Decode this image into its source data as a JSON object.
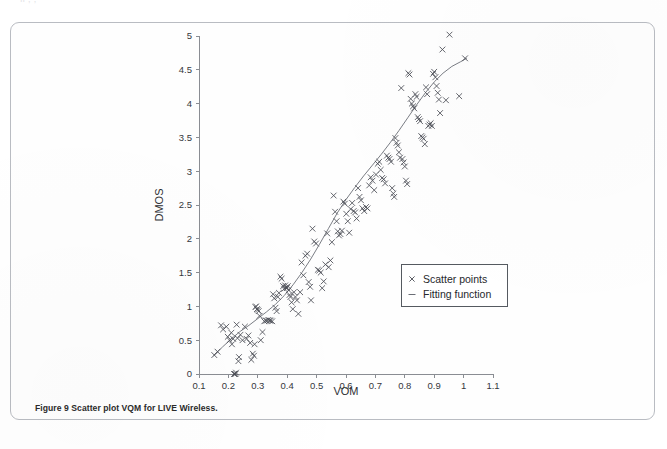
{
  "page": {
    "background_color": "#ffffff",
    "clipped_top_text": "       ll                                                          ,                   ,"
  },
  "figure": {
    "frame_color": "#b9bcc2",
    "caption_label": "Figure 9",
    "caption_text": "Scatter plot VQM for LIVE Wireless.",
    "caption_full": "Figure 9 Scatter plot VQM for LIVE Wireless."
  },
  "legend": {
    "position": "inside-right-lower",
    "border_color": "#555a60",
    "items": [
      {
        "marker": "x",
        "label": "Scatter points"
      },
      {
        "marker": "-",
        "label": "Fitting function"
      }
    ]
  },
  "chart_data": {
    "type": "scatter",
    "title": "",
    "xlabel": "VQM",
    "ylabel": "DMOS",
    "xlim": [
      0.1,
      1.1
    ],
    "ylim": [
      0,
      5
    ],
    "xticks": [
      "0.1",
      "0.2",
      "0.3",
      "0.4",
      "0.5",
      "0.6",
      "0.7",
      "0.8",
      "0.9",
      "1",
      "1.1"
    ],
    "xtick_values": [
      0.1,
      0.2,
      0.3,
      0.4,
      0.5,
      0.6,
      0.7,
      0.8,
      0.9,
      1.0,
      1.1
    ],
    "yticks": [
      "0",
      "0.5",
      "1",
      "1.5",
      "2",
      "2.5",
      "3",
      "3.5",
      "4",
      "4.5",
      "5"
    ],
    "ytick_values": [
      0,
      0.5,
      1,
      1.5,
      2,
      2.5,
      3,
      3.5,
      4,
      4.5,
      5
    ],
    "grid": false,
    "axis_color": "#8a8d93",
    "marker_color": "#4a4d55",
    "line_color": "#6b6e76",
    "marker_symbol": "x",
    "series": [
      {
        "name": "Scatter points",
        "type": "scatter",
        "points": [
          [
            0.152,
            0.28
          ],
          [
            0.163,
            0.33
          ],
          [
            0.175,
            0.72
          ],
          [
            0.182,
            0.66
          ],
          [
            0.193,
            0.7
          ],
          [
            0.198,
            0.55
          ],
          [
            0.204,
            0.5
          ],
          [
            0.21,
            0.61
          ],
          [
            0.212,
            0.44
          ],
          [
            0.216,
            0.52
          ],
          [
            0.219,
            0.0
          ],
          [
            0.222,
            0.0
          ],
          [
            0.224,
            0.0
          ],
          [
            0.226,
            0.02
          ],
          [
            0.228,
            0.73
          ],
          [
            0.231,
            0.53
          ],
          [
            0.234,
            0.19
          ],
          [
            0.236,
            0.25
          ],
          [
            0.241,
            0.58
          ],
          [
            0.248,
            0.5
          ],
          [
            0.256,
            0.7
          ],
          [
            0.262,
            0.52
          ],
          [
            0.268,
            0.57
          ],
          [
            0.274,
            0.46
          ],
          [
            0.278,
            0.21
          ],
          [
            0.283,
            0.3
          ],
          [
            0.287,
            0.27
          ],
          [
            0.289,
            0.44
          ],
          [
            0.292,
            0.99
          ],
          [
            0.294,
            1.0
          ],
          [
            0.297,
            0.96
          ],
          [
            0.3,
            0.95
          ],
          [
            0.303,
            0.93
          ],
          [
            0.306,
            0.86
          ],
          [
            0.31,
            0.5
          ],
          [
            0.316,
            0.62
          ],
          [
            0.322,
            0.78
          ],
          [
            0.327,
            0.79
          ],
          [
            0.331,
            0.79
          ],
          [
            0.336,
            0.8
          ],
          [
            0.34,
            0.79
          ],
          [
            0.344,
            0.79
          ],
          [
            0.349,
            0.78
          ],
          [
            0.352,
            1.18
          ],
          [
            0.356,
            1.12
          ],
          [
            0.36,
            0.98
          ],
          [
            0.364,
            0.93
          ],
          [
            0.368,
            1.14
          ],
          [
            0.372,
            1.2
          ],
          [
            0.377,
            1.44
          ],
          [
            0.381,
            1.41
          ],
          [
            0.386,
            1.3
          ],
          [
            0.39,
            1.26
          ],
          [
            0.393,
            1.31
          ],
          [
            0.396,
            1.28
          ],
          [
            0.399,
            1.27
          ],
          [
            0.402,
            1.3
          ],
          [
            0.405,
            1.24
          ],
          [
            0.408,
            1.17
          ],
          [
            0.411,
            1.14
          ],
          [
            0.415,
            1.06
          ],
          [
            0.419,
            0.96
          ],
          [
            0.423,
            1.21
          ],
          [
            0.428,
            1.14
          ],
          [
            0.433,
            1.09
          ],
          [
            0.438,
            0.89
          ],
          [
            0.444,
            1.21
          ],
          [
            0.449,
            1.65
          ],
          [
            0.455,
            1.46
          ],
          [
            0.462,
            1.75
          ],
          [
            0.468,
            1.78
          ],
          [
            0.473,
            1.36
          ],
          [
            0.478,
            1.29
          ],
          [
            0.481,
            1.09
          ],
          [
            0.486,
            2.15
          ],
          [
            0.492,
            1.96
          ],
          [
            0.498,
            1.93
          ],
          [
            0.504,
            1.54
          ],
          [
            0.509,
            1.53
          ],
          [
            0.514,
            1.5
          ],
          [
            0.519,
            1.27
          ],
          [
            0.524,
            1.37
          ],
          [
            0.53,
            1.62
          ],
          [
            0.536,
            2.08
          ],
          [
            0.541,
            1.58
          ],
          [
            0.547,
            1.68
          ],
          [
            0.552,
            1.95
          ],
          [
            0.558,
            2.64
          ],
          [
            0.563,
            2.4
          ],
          [
            0.568,
            2.26
          ],
          [
            0.572,
            2.11
          ],
          [
            0.576,
            2.05
          ],
          [
            0.581,
            2.07
          ],
          [
            0.586,
            2.12
          ],
          [
            0.591,
            2.55
          ],
          [
            0.596,
            2.52
          ],
          [
            0.601,
            2.37
          ],
          [
            0.606,
            2.26
          ],
          [
            0.611,
            2.09
          ],
          [
            0.616,
            2.44
          ],
          [
            0.621,
            2.53
          ],
          [
            0.626,
            2.41
          ],
          [
            0.631,
            2.39
          ],
          [
            0.636,
            2.3
          ],
          [
            0.641,
            2.75
          ],
          [
            0.646,
            2.62
          ],
          [
            0.651,
            2.57
          ],
          [
            0.656,
            2.45
          ],
          [
            0.662,
            2.41
          ],
          [
            0.668,
            2.47
          ],
          [
            0.673,
            2.45
          ],
          [
            0.679,
            2.79
          ],
          [
            0.684,
            2.91
          ],
          [
            0.69,
            2.86
          ],
          [
            0.696,
            2.72
          ],
          [
            0.702,
            2.95
          ],
          [
            0.708,
            3.11
          ],
          [
            0.713,
            3.14
          ],
          [
            0.718,
            3.02
          ],
          [
            0.723,
            2.9
          ],
          [
            0.728,
            2.88
          ],
          [
            0.733,
            2.82
          ],
          [
            0.739,
            3.23
          ],
          [
            0.744,
            3.2
          ],
          [
            0.748,
            3.18
          ],
          [
            0.753,
            3.14
          ],
          [
            0.757,
            2.75
          ],
          [
            0.761,
            2.67
          ],
          [
            0.764,
            2.62
          ],
          [
            0.768,
            3.49
          ],
          [
            0.772,
            3.42
          ],
          [
            0.776,
            3.38
          ],
          [
            0.78,
            3.28
          ],
          [
            0.784,
            3.2
          ],
          [
            0.788,
            4.23
          ],
          [
            0.792,
            3.18
          ],
          [
            0.796,
            3.13
          ],
          [
            0.8,
            3.07
          ],
          [
            0.804,
            2.86
          ],
          [
            0.808,
            2.81
          ],
          [
            0.812,
            4.45
          ],
          [
            0.816,
            4.43
          ],
          [
            0.82,
            4.07
          ],
          [
            0.824,
            4.0
          ],
          [
            0.828,
            3.96
          ],
          [
            0.832,
            3.93
          ],
          [
            0.836,
            4.14
          ],
          [
            0.84,
            4.1
          ],
          [
            0.844,
            3.8
          ],
          [
            0.848,
            3.77
          ],
          [
            0.852,
            3.74
          ],
          [
            0.856,
            3.52
          ],
          [
            0.86,
            3.5
          ],
          [
            0.864,
            3.48
          ],
          [
            0.868,
            3.4
          ],
          [
            0.872,
            4.24
          ],
          [
            0.876,
            4.14
          ],
          [
            0.88,
            3.67
          ],
          [
            0.884,
            3.69
          ],
          [
            0.888,
            3.71
          ],
          [
            0.892,
            3.67
          ],
          [
            0.896,
            4.44
          ],
          [
            0.9,
            4.47
          ],
          [
            0.904,
            4.39
          ],
          [
            0.908,
            4.26
          ],
          [
            0.912,
            4.16
          ],
          [
            0.916,
            4.06
          ],
          [
            0.92,
            3.86
          ],
          [
            0.928,
            4.8
          ],
          [
            0.94,
            4.05
          ],
          [
            0.952,
            5.02
          ],
          [
            0.985,
            4.11
          ],
          [
            1.005,
            4.67
          ]
        ]
      },
      {
        "name": "Fitting function",
        "type": "line",
        "points": [
          [
            0.15,
            0.27
          ],
          [
            0.18,
            0.4
          ],
          [
            0.21,
            0.52
          ],
          [
            0.24,
            0.63
          ],
          [
            0.27,
            0.72
          ],
          [
            0.3,
            0.82
          ],
          [
            0.33,
            0.92
          ],
          [
            0.36,
            1.03
          ],
          [
            0.39,
            1.16
          ],
          [
            0.42,
            1.32
          ],
          [
            0.45,
            1.5
          ],
          [
            0.48,
            1.7
          ],
          [
            0.51,
            1.92
          ],
          [
            0.54,
            2.15
          ],
          [
            0.57,
            2.38
          ],
          [
            0.6,
            2.58
          ],
          [
            0.63,
            2.76
          ],
          [
            0.66,
            2.93
          ],
          [
            0.69,
            3.09
          ],
          [
            0.72,
            3.25
          ],
          [
            0.75,
            3.42
          ],
          [
            0.78,
            3.6
          ],
          [
            0.81,
            3.79
          ],
          [
            0.84,
            3.98
          ],
          [
            0.87,
            4.16
          ],
          [
            0.9,
            4.32
          ],
          [
            0.93,
            4.45
          ],
          [
            0.96,
            4.55
          ],
          [
            0.99,
            4.62
          ],
          [
            1.01,
            4.67
          ]
        ]
      }
    ]
  }
}
